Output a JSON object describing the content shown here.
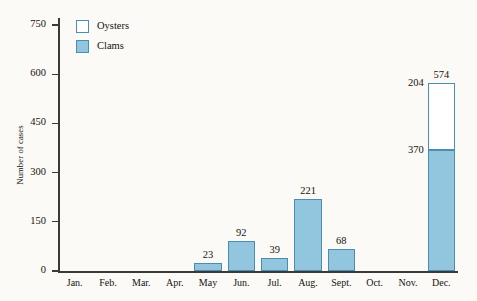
{
  "chart_data": {
    "type": "bar",
    "subtype": "stacked-vertical",
    "title": "",
    "xlabel": "",
    "ylabel": "Number of cases",
    "ylim": [
      0,
      750
    ],
    "yticks": [
      0,
      150,
      300,
      450,
      600,
      750
    ],
    "grid": false,
    "categories": [
      "Jan.",
      "Feb.",
      "Mar.",
      "Apr.",
      "May",
      "Jun.",
      "Jul.",
      "Aug.",
      "Sept.",
      "Oct.",
      "Nov.",
      "Dec."
    ],
    "series": [
      {
        "name": "Clams",
        "color": "#92c5de",
        "values": [
          0,
          0,
          0,
          0,
          23,
          92,
          39,
          221,
          68,
          0,
          0,
          370
        ]
      },
      {
        "name": "Oysters",
        "color": "#ffffff",
        "values": [
          0,
          0,
          0,
          0,
          0,
          0,
          0,
          0,
          0,
          0,
          0,
          204
        ]
      }
    ],
    "totals": [
      0,
      0,
      0,
      0,
      23,
      92,
      39,
      221,
      68,
      0,
      0,
      574
    ],
    "bar_labels": [
      "",
      "",
      "",
      "",
      "23",
      "92",
      "39",
      "221",
      "68",
      "",
      "",
      "574"
    ],
    "annotations": [
      {
        "text": "204",
        "series": "Oysters",
        "category": "Dec."
      },
      {
        "text": "370",
        "series": "Clams",
        "category": "Dec."
      }
    ],
    "legend": {
      "position": "top-left",
      "entries": [
        {
          "label": "Oysters",
          "color": "#ffffff"
        },
        {
          "label": "Clams",
          "color": "#92c5de"
        }
      ]
    },
    "axis_color": "#3b3a36",
    "bar_border_color": "#4a8fb3",
    "background": "#fbfaf6"
  }
}
